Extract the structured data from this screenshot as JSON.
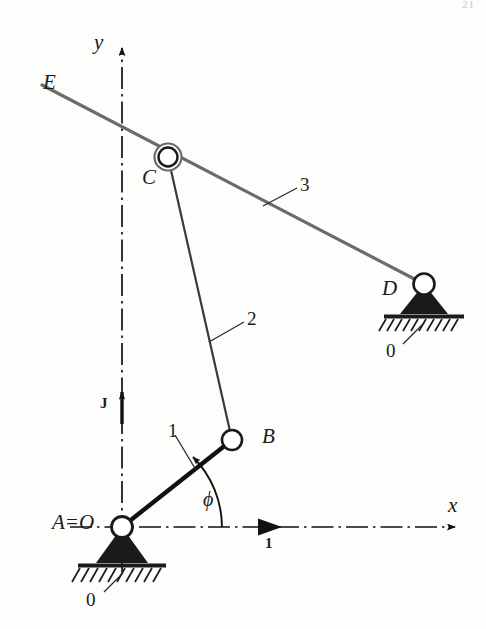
{
  "figure": {
    "page_number": "21",
    "colors": {
      "ink": "#1a1a1a",
      "link3_gray": "#6b6b6b",
      "link2_gray": "#555555",
      "axis": "#111111",
      "paper": "#fdfdfc"
    }
  },
  "axes": {
    "x_label": "x",
    "y_label": "y",
    "unit_vector_x_label": "1",
    "unit_vector_y_label": "J",
    "origin_label": "A=O"
  },
  "joints": [
    {
      "id": "A",
      "label": "A=O",
      "type": "grounded-pivot",
      "x": 122,
      "y": 527
    },
    {
      "id": "B",
      "label": "B",
      "type": "pin-joint",
      "x": 232,
      "y": 440
    },
    {
      "id": "C",
      "label": "C",
      "type": "double-pin-joint",
      "x": 168,
      "y": 157
    },
    {
      "id": "D",
      "label": "D",
      "type": "grounded-pivot",
      "x": 424,
      "y": 284
    },
    {
      "id": "E",
      "label": "E",
      "type": "link-end",
      "x": 42,
      "y": 85
    }
  ],
  "links": [
    {
      "id": "1",
      "label": "1",
      "from": "A",
      "to": "B",
      "style": "thick-black"
    },
    {
      "id": "2",
      "label": "2",
      "from": "B",
      "to": "C",
      "style": "thin-black"
    },
    {
      "id": "3",
      "label": "3",
      "from": "E",
      "to": "D",
      "style": "thick-gray"
    }
  ],
  "ground_labels": [
    {
      "label": "0",
      "at": "A"
    },
    {
      "label": "0",
      "at": "D"
    }
  ],
  "angles": [
    {
      "label": "ϕ",
      "name": "phi",
      "from": "x-axis",
      "to": "link-1"
    }
  ]
}
